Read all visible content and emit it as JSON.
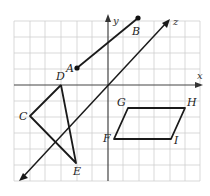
{
  "figure": {
    "type": "coordinate-plane-geometry",
    "axes": {
      "x_label": "x",
      "y_label": "y",
      "z_label": "z"
    },
    "points": {
      "A": {
        "label": "A"
      },
      "B": {
        "label": "B"
      },
      "C": {
        "label": "C"
      },
      "D": {
        "label": "D"
      },
      "E": {
        "label": "E"
      },
      "F": {
        "label": "F"
      },
      "G": {
        "label": "G"
      },
      "H": {
        "label": "H"
      },
      "I": {
        "label": "I"
      }
    },
    "elements": [
      {
        "kind": "ray",
        "name": "ray AB",
        "from": "A",
        "to": "B",
        "endpoint_dots": [
          "A",
          "B"
        ]
      },
      {
        "kind": "line",
        "name": "line z",
        "arrows": "both",
        "passes_through_origin": true
      },
      {
        "kind": "polyline",
        "name": "path C-D-E-C",
        "vertices": [
          "D",
          "C",
          "E",
          "D"
        ]
      },
      {
        "kind": "parallelogram",
        "name": "FGHI",
        "vertices": [
          "F",
          "G",
          "H",
          "I"
        ]
      }
    ],
    "colors": {
      "grid": "#cfcfcf",
      "lines": "#1a1a1a",
      "background": "#ffffff"
    }
  }
}
